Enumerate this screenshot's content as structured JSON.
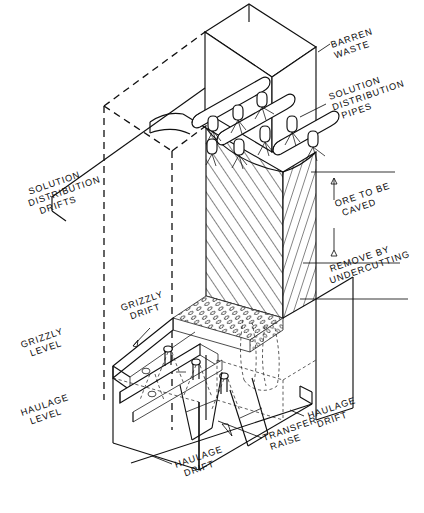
{
  "figure": {
    "kind": "engineering-isometric-diagram",
    "background_color": "#ffffff",
    "line_color": "#101010",
    "width": 424,
    "height": 513
  },
  "labels": {
    "barren_waste": {
      "lines": [
        "BARREN",
        "WASTE"
      ],
      "x": 332,
      "y": 48,
      "rotate": -19
    },
    "solution_distribution_pipes": {
      "lines": [
        "SOLUTION",
        "DISTRIBUTION",
        "PIPES"
      ],
      "x": 330,
      "y": 100,
      "rotate": -19
    },
    "solution_distribution_drifts": {
      "lines": [
        "SOLUTION",
        "DISTRIBUTION",
        "DRIFTS"
      ],
      "x": 26,
      "y": 196,
      "rotate": -19
    },
    "ore_to_be_caved": {
      "lines": [
        "ORE TO BE",
        "CAVED"
      ],
      "x": 336,
      "y": 207,
      "rotate": -19
    },
    "remove_by_undercutting": {
      "lines": [
        "REMOVE BY",
        "UNDERCUTTING"
      ],
      "x": 331,
      "y": 272,
      "rotate": -19
    },
    "grizzly_drift": {
      "lines": [
        "GRIZZLY",
        "DRIFT"
      ],
      "x": 122,
      "y": 311,
      "rotate": -19
    },
    "grizzly_level": {
      "lines": [
        "GRIZZLY",
        "LEVEL"
      ],
      "x": 22,
      "y": 348,
      "rotate": -19
    },
    "haulage_level": {
      "lines": [
        "HAULAGE",
        "LEVEL"
      ],
      "x": 22,
      "y": 416,
      "rotate": -19
    },
    "haulage_drift_right": {
      "lines": [
        "HAULAGE",
        "DRIFT"
      ],
      "x": 309,
      "y": 419,
      "rotate": -19
    },
    "transfer_raise": {
      "lines": [
        "TRANSFER",
        "RAISE"
      ],
      "x": 264,
      "y": 441,
      "rotate": -19
    },
    "haulage_drift_bottom": {
      "lines": [
        "HAULAGE",
        "DRIFT"
      ],
      "x": 176,
      "y": 468,
      "rotate": -19
    }
  },
  "regions": {
    "barren_waste_block": "upper solid-outline block, unshaded",
    "ore_block_front": "diagonal hatching, lower-left to upper-right",
    "ore_block_right": "diagonal hatching, steeper, opposite sense",
    "broken_ore_cap": "stippled circles on grizzly level top surface",
    "undercut_zone": "dashed outlines below ore block"
  }
}
